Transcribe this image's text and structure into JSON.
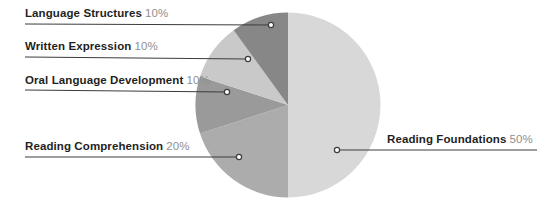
{
  "figure": {
    "background_color": "#ffffff",
    "leader_line_color": "#3d3d3d",
    "label_text_color": "#1f1f1f",
    "percent_text_color": "#8f8f8f"
  },
  "chart_data": {
    "type": "pie",
    "title": "",
    "legend_position": "callout-labels",
    "start_angle": "12-o-clock, clockwise",
    "slices": [
      {
        "label": "Reading Foundations",
        "value": 50,
        "pct_label": "50%",
        "color": "#d8d8d8"
      },
      {
        "label": "Reading Comprehension",
        "value": 20,
        "pct_label": "20%",
        "color": "#acacac"
      },
      {
        "label": "Oral Language Development",
        "value": 10,
        "pct_label": "10%",
        "color": "#9a9a9a"
      },
      {
        "label": "Written Expression",
        "value": 10,
        "pct_label": "10%",
        "color": "#c9c9c9"
      },
      {
        "label": "Language Structures",
        "value": 10,
        "pct_label": "10%",
        "color": "#878787"
      }
    ]
  }
}
